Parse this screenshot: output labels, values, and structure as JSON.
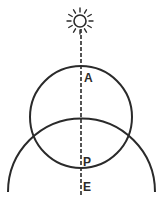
{
  "diagram": {
    "type": "geometric-illustration",
    "colors": {
      "ink": "#2a2a2a",
      "background": "#ffffff"
    },
    "sun": {
      "icon": "sun-icon",
      "cx": 80,
      "cy": 21,
      "r": 6,
      "ray_count": 12
    },
    "line": {
      "style": "dashed",
      "x": 81,
      "y1": 29,
      "y2": 197
    },
    "upper_circle": {
      "cx": 81,
      "cy": 117,
      "r": 51
    },
    "lower_arc": {
      "cx": 81,
      "cy": 191,
      "r": 73,
      "start": [
        8,
        192
      ],
      "end": [
        155,
        192
      ]
    },
    "labels": [
      {
        "text": "A",
        "x": 84,
        "y": 82
      },
      {
        "text": "P",
        "x": 83,
        "y": 166
      },
      {
        "text": "E",
        "x": 83,
        "y": 191
      }
    ]
  }
}
